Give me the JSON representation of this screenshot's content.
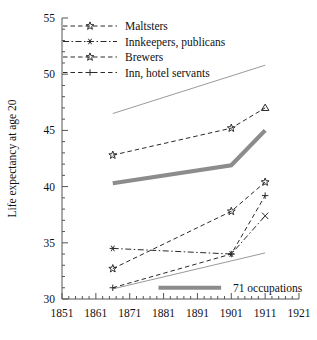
{
  "chart_data": {
    "type": "line",
    "title": "",
    "xlabel": "",
    "ylabel": "Life expectancy at age 20",
    "xlim": [
      1851,
      1921
    ],
    "ylim": [
      30,
      55
    ],
    "xticks": [
      1851,
      1861,
      1871,
      1881,
      1891,
      1901,
      1911,
      1921
    ],
    "yticks": [
      30,
      35,
      40,
      45,
      50,
      55
    ],
    "x_minor_step": 2,
    "y_minor_step": 1,
    "grid": false,
    "legend_position": "top-left",
    "x": [
      1866,
      1901,
      1911
    ],
    "series": [
      {
        "name": "Maltsters",
        "marker": "open-star",
        "dash": "dashed",
        "values": [
          42.8,
          45.2,
          47.0
        ]
      },
      {
        "name": "Innkeepers, publicans",
        "marker": "asterisk",
        "dash": "dash-dot",
        "values": [
          34.5,
          34.0,
          37.4
        ]
      },
      {
        "name": "Brewers",
        "marker": "filled-star",
        "dash": "dashed",
        "values": [
          32.7,
          37.8,
          40.4
        ]
      },
      {
        "name": "Inn, hotel servants",
        "marker": "plus",
        "dash": "dashed",
        "values": [
          31.0,
          34.0,
          39.2
        ]
      }
    ],
    "reference_bands": [
      {
        "name": "upper-envelope",
        "style": "thin-gray",
        "x": [
          1866,
          1911
        ],
        "values": [
          46.5,
          50.8
        ]
      },
      {
        "name": "lower-envelope",
        "style": "thin-gray",
        "x": [
          1866,
          1911
        ],
        "values": [
          30.9,
          34.1
        ]
      },
      {
        "name": "71 occupations",
        "style": "thick-gray",
        "x": [
          1866,
          1901,
          1911
        ],
        "values": [
          40.3,
          41.9,
          45.0
        ]
      }
    ],
    "annotations": [
      {
        "name": "71 occupations",
        "label": "71 occupations",
        "x": 1891,
        "y": 31.0
      }
    ]
  },
  "legend": {
    "items": [
      {
        "label": "Maltsters"
      },
      {
        "label": "Innkeepers, publicans"
      },
      {
        "label": "Brewers"
      },
      {
        "label": "Inn, hotel servants"
      }
    ]
  },
  "axes": {
    "ylabel": "Life expectancy at age 20",
    "xticklabels": [
      "1851",
      "1861",
      "1871",
      "1881",
      "1891",
      "1901",
      "1911",
      "1921"
    ],
    "yticklabels": [
      "30",
      "35",
      "40",
      "45",
      "50",
      "55"
    ]
  },
  "colors": {
    "series": "#2b2b2b",
    "thin_gray": "#9a9a9a",
    "thick_gray": "#8c8c8c",
    "axis": "#555555",
    "text": "#111111",
    "background": "#ffffff"
  }
}
